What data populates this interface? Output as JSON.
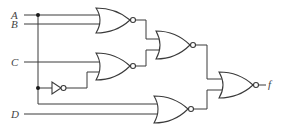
{
  "diagram": {
    "type": "logic-circuit",
    "inputs": [
      {
        "id": "A",
        "label": "A"
      },
      {
        "id": "B",
        "label": "B"
      },
      {
        "id": "C",
        "label": "C"
      },
      {
        "id": "D",
        "label": "D"
      }
    ],
    "output": {
      "id": "f",
      "label": "f"
    },
    "gates": [
      {
        "id": "g1",
        "type": "NOR",
        "inputs": [
          "A",
          "B"
        ]
      },
      {
        "id": "g2",
        "type": "NOR",
        "inputs": [
          "C",
          "not_A"
        ]
      },
      {
        "id": "inv1",
        "type": "NOT",
        "inputs": [
          "A"
        ]
      },
      {
        "id": "g3",
        "type": "NOR",
        "inputs": [
          "g1",
          "g2"
        ]
      },
      {
        "id": "g4",
        "type": "NOR",
        "inputs": [
          "A",
          "D"
        ]
      },
      {
        "id": "g5",
        "type": "NOR",
        "inputs": [
          "g3",
          "g4"
        ]
      }
    ],
    "colors": {
      "line": "#3a3a3a",
      "background": "#ffffff",
      "junction": "#1a1a1a"
    }
  }
}
